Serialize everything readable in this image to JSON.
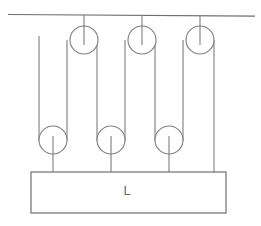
{
  "diagram": {
    "type": "mechanical-schematic",
    "canvas": {
      "width": 261,
      "height": 226,
      "background": "#ffffff"
    },
    "stroke_color": "#7d7d7d",
    "ceiling": {
      "label": "ceiling-support",
      "x1": 8,
      "y1": 14.5,
      "x2": 255,
      "y2": 16.2
    },
    "load_block": {
      "label": "L",
      "x": 31,
      "y": 172,
      "width": 195,
      "height": 41,
      "fill": "#ffffff",
      "stroke": "#6f6f6f",
      "label_x": 127,
      "label_y": 192
    },
    "fixed_pulleys": [
      {
        "name": "fixed-pulley-1",
        "cx": 84,
        "cy": 40,
        "r": 14,
        "stub_from_y": 15.0
      },
      {
        "name": "fixed-pulley-2",
        "cx": 142,
        "cy": 40,
        "r": 14,
        "stub_from_y": 15.4
      },
      {
        "name": "fixed-pulley-3",
        "cx": 200,
        "cy": 40,
        "r": 14,
        "stub_from_y": 15.8
      }
    ],
    "movable_pulleys": [
      {
        "name": "movable-pulley-1",
        "cx": 53,
        "cy": 140,
        "r": 14,
        "stub_to_y": 172
      },
      {
        "name": "movable-pulley-2",
        "cx": 111,
        "cy": 140,
        "r": 14,
        "stub_to_y": 172
      },
      {
        "name": "movable-pulley-3",
        "cx": 169,
        "cy": 140,
        "r": 14,
        "stub_to_y": 172
      }
    ],
    "rope_segments": [
      {
        "name": "rope-free-end",
        "x1": 39,
        "y1": 36,
        "x2": 39,
        "y2": 140
      },
      {
        "name": "rope-mp1-to-fp1",
        "x1": 67,
        "y1": 140,
        "x2": 67,
        "y2": 40
      },
      {
        "name": "rope-fp1-to-mp2",
        "x1": 97,
        "y1": 40,
        "x2": 97,
        "y2": 140
      },
      {
        "name": "rope-mp2-to-fp2",
        "x1": 125,
        "y1": 140,
        "x2": 125,
        "y2": 40
      },
      {
        "name": "rope-fp2-to-mp3",
        "x1": 155,
        "y1": 40,
        "x2": 155,
        "y2": 140
      },
      {
        "name": "rope-mp3-to-fp3",
        "x1": 183,
        "y1": 140,
        "x2": 183,
        "y2": 40
      },
      {
        "name": "rope-fp3-to-load",
        "x1": 214,
        "y1": 40,
        "x2": 214,
        "y2": 172
      }
    ],
    "counts": {
      "fixed_pulleys": 3,
      "movable_pulleys": 3,
      "rope_segments": 7
    }
  }
}
